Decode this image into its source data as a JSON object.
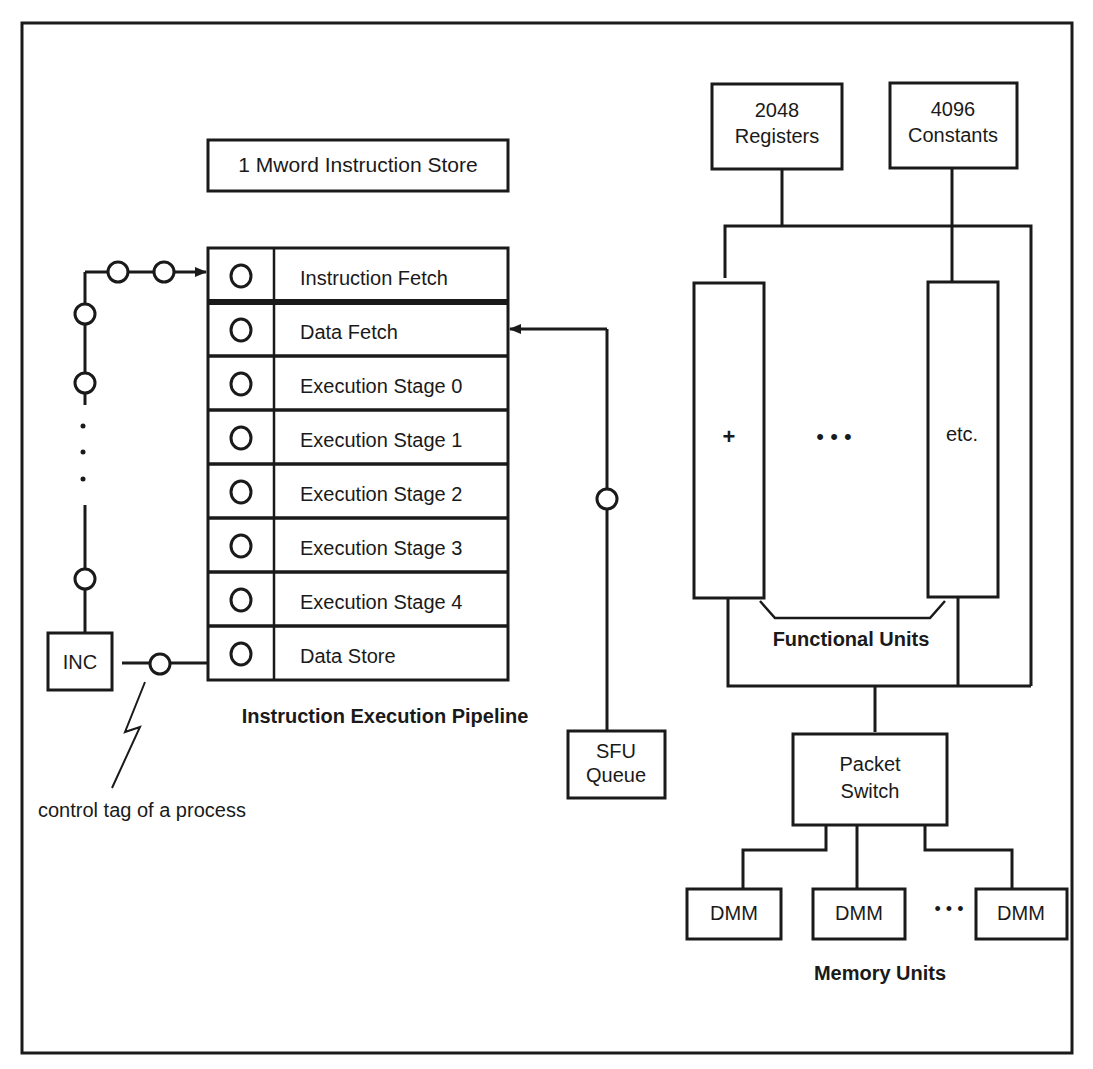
{
  "diagram": {
    "instruction_store": "1 Mword Instruction Store",
    "pipeline": {
      "title": "Instruction Execution Pipeline",
      "stages": [
        "Instruction Fetch",
        "Data Fetch",
        "Execution Stage 0",
        "Execution Stage 1",
        "Execution Stage 2",
        "Execution Stage 3",
        "Execution Stage 4",
        "Data Store"
      ]
    },
    "inc_label": "INC",
    "control_tag_label": "control tag of a process",
    "sfu_queue": {
      "line1": "SFU",
      "line2": "Queue"
    },
    "registers": {
      "line1": "2048",
      "line2": "Registers"
    },
    "constants": {
      "line1": "4096",
      "line2": "Constants"
    },
    "functional_units": {
      "title": "Functional Units",
      "first_unit": "+",
      "ellipsis": "• • •",
      "last_unit": "etc."
    },
    "packet_switch": {
      "line1": "Packet",
      "line2": "Switch"
    },
    "memory_units": {
      "title": "Memory Units",
      "modules": [
        "DMM",
        "DMM",
        "DMM"
      ],
      "ellipsis": "• • •"
    }
  }
}
